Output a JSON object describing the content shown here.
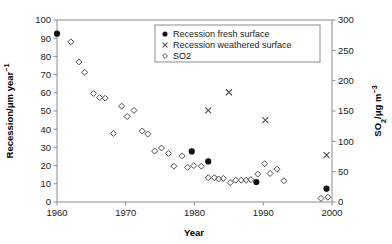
{
  "chart_data": {
    "type": "scatter",
    "title": "",
    "xlabel": "Year",
    "ylabel": "Recession/μm year⁻¹",
    "y2label": "SO₂/μg m⁻³",
    "xlim": [
      1960,
      2000
    ],
    "ylim": [
      0,
      100
    ],
    "y2lim": [
      0,
      300
    ],
    "xticks": [
      1960,
      1970,
      1980,
      1990,
      2000
    ],
    "xticklabels": [
      "1960",
      "1970",
      "1980",
      "1990",
      "2000"
    ],
    "yticks": [
      0,
      10,
      20,
      30,
      40,
      50,
      60,
      70,
      80,
      90,
      100
    ],
    "yticklabels": [
      "0",
      "10",
      "20",
      "30",
      "40",
      "50",
      "60",
      "70",
      "80",
      "90",
      "100"
    ],
    "y2ticks": [
      0,
      50,
      100,
      150,
      200,
      250,
      300
    ],
    "y2ticklabels": [
      "0",
      "50",
      "100",
      "150",
      "200",
      "250",
      "300"
    ],
    "grid": false,
    "legend_position": "top-center",
    "series": [
      {
        "name": "Recession fresh surface",
        "marker": "filled-circle",
        "axis": "left",
        "color": "#111111",
        "points": [
          {
            "x": 1960.0,
            "y": 92.5
          },
          {
            "x": 1979.6,
            "y": 27.8
          },
          {
            "x": 1982.0,
            "y": 22.3
          },
          {
            "x": 1989.0,
            "y": 11.0
          },
          {
            "x": 1999.2,
            "y": 7.3
          }
        ]
      },
      {
        "name": "Recession weathered surface",
        "marker": "cross",
        "axis": "left",
        "color": "#4d4d4d",
        "points": [
          {
            "x": 1982.0,
            "y": 50.3
          },
          {
            "x": 1985.0,
            "y": 60.3
          },
          {
            "x": 1990.3,
            "y": 45.0
          },
          {
            "x": 1999.2,
            "y": 25.7
          }
        ]
      },
      {
        "name": "SO2",
        "marker": "open-diamond",
        "axis": "right",
        "color": "#4d4d4d",
        "points": [
          {
            "x": 1962.0,
            "y": 264
          },
          {
            "x": 1963.2,
            "y": 231
          },
          {
            "x": 1964.0,
            "y": 214
          },
          {
            "x": 1965.3,
            "y": 179
          },
          {
            "x": 1966.2,
            "y": 172
          },
          {
            "x": 1967.0,
            "y": 171
          },
          {
            "x": 1968.2,
            "y": 113
          },
          {
            "x": 1969.4,
            "y": 158
          },
          {
            "x": 1970.2,
            "y": 141
          },
          {
            "x": 1971.2,
            "y": 151
          },
          {
            "x": 1972.4,
            "y": 117
          },
          {
            "x": 1973.2,
            "y": 112
          },
          {
            "x": 1974.2,
            "y": 84
          },
          {
            "x": 1975.2,
            "y": 89
          },
          {
            "x": 1976.2,
            "y": 80
          },
          {
            "x": 1977.0,
            "y": 59
          },
          {
            "x": 1978.2,
            "y": 76
          },
          {
            "x": 1979.0,
            "y": 57
          },
          {
            "x": 1979.9,
            "y": 60
          },
          {
            "x": 1981.0,
            "y": 59
          },
          {
            "x": 1982.0,
            "y": 40
          },
          {
            "x": 1982.9,
            "y": 40
          },
          {
            "x": 1983.5,
            "y": 38
          },
          {
            "x": 1984.2,
            "y": 39
          },
          {
            "x": 1985.2,
            "y": 32
          },
          {
            "x": 1986.0,
            "y": 36
          },
          {
            "x": 1986.8,
            "y": 36
          },
          {
            "x": 1987.5,
            "y": 36
          },
          {
            "x": 1988.2,
            "y": 37
          },
          {
            "x": 1989.2,
            "y": 46
          },
          {
            "x": 1990.2,
            "y": 63
          },
          {
            "x": 1991.0,
            "y": 47
          },
          {
            "x": 1992.0,
            "y": 54
          },
          {
            "x": 1993.0,
            "y": 35
          },
          {
            "x": 1998.4,
            "y": 6
          },
          {
            "x": 1999.4,
            "y": 8
          }
        ]
      }
    ],
    "legend": [
      {
        "label": "Recession fresh surface",
        "marker": "filled-circle"
      },
      {
        "label": "Recession weathered surface",
        "marker": "cross"
      },
      {
        "label": "SO2",
        "marker": "open-diamond"
      }
    ]
  },
  "figure": {
    "plot_left": 57,
    "plot_right": 332,
    "plot_top": 20,
    "plot_bottom": 202
  }
}
